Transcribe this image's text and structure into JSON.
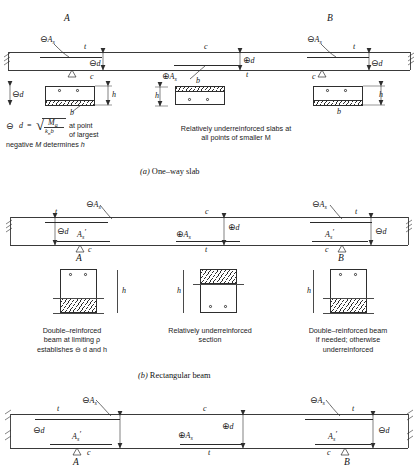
{
  "figure": {
    "title_note": "Reinforced concrete design — depth determination diagrams"
  },
  "symbols": {
    "neg": "⊖",
    "pos": "⊕",
    "neg_As": "⊖A",
    "pos_As": "⊕A",
    "neg_d": "⊖d",
    "pos_d": "⊕d",
    "sub_s": "s",
    "t": "t",
    "c": "c",
    "h": "h",
    "b": "b",
    "d": "d",
    "A": "A",
    "B": "B",
    "As_prime": "A",
    "prime_mark": "′"
  },
  "panel_a": {
    "id": "one-way-slab",
    "caption": "One–way slab",
    "caption_letter": "(a)",
    "point_left": "A",
    "point_right": "B",
    "labels": {
      "neg_As_left": "⊖A",
      "neg_As_right": "⊖A",
      "pos_As_mid": "⊕A",
      "t_left": "t",
      "t_mid": "t",
      "t_right": "t",
      "c_left": "c",
      "c_mid": "c",
      "c_right": "c",
      "neg_d_left": "⊖d",
      "pos_d_mid": "⊕d",
      "neg_d_right": "⊖d"
    },
    "sections": [
      {
        "name": "section-left",
        "h_label": "h",
        "d_label": "⊖d",
        "b_label": "b",
        "hatch_position": "bottom",
        "bars_position": "top",
        "bar_count": 2
      },
      {
        "name": "section-mid",
        "h_label": "h",
        "d_label": "",
        "b_label": "b",
        "hatch_position": "top",
        "bars_position": "bottom",
        "bar_count": 2
      },
      {
        "name": "section-right",
        "h_label": "h",
        "d_label": "",
        "b_label": "b",
        "hatch_position": "bottom",
        "bars_position": "top",
        "bar_count": 2
      }
    ],
    "formula": {
      "lead_symbol": "⊖",
      "lhs": "d",
      "equals": "=",
      "radical": "√",
      "numerator": "M",
      "numerator_sub": "a",
      "denominator": "k",
      "denominator_sub": "n",
      "denominator_tail": "b",
      "text_line1": "at point",
      "text_line2": "of largest",
      "text_line3": "negative M determines h"
    },
    "note_right": "Relatively underreinforced slabs at\nall points of smaller M"
  },
  "panel_b": {
    "id": "rectangular-beam",
    "caption": "Rectangular beam",
    "caption_letter": "(b)",
    "point_left": "A",
    "point_right": "B",
    "labels": {
      "neg_As_left": "⊖A",
      "neg_As_right": "⊖A",
      "pos_As_mid": "⊕A",
      "As_prime_left": "A",
      "As_prime_right": "A",
      "t_left": "t",
      "t_mid": "t",
      "t_right": "t",
      "c_left": "c",
      "c_mid": "c",
      "c_right": "c",
      "neg_d_left": "⊖d",
      "pos_d_mid": "⊕d",
      "neg_d_right": "⊖d"
    },
    "sections": [
      {
        "name": "section-left",
        "h_label": "h",
        "hatch_position": "bottom",
        "bars_position": "top",
        "bar_count": 2
      },
      {
        "name": "section-mid",
        "h_label": "h",
        "hatch_position": "top",
        "bars_position": "bottom",
        "bar_count": 2
      },
      {
        "name": "section-right",
        "h_label": "h",
        "hatch_position": "bottom",
        "bars_position": "top",
        "bar_count": 2
      }
    ],
    "notes": [
      "Double–reinforced\nbeam at limiting ρ\nestablishes ⊖ d and h",
      "Relatively underreinforced\nsection",
      "Double–reinforced beam\nif needed; otherwise\nunderreinforced"
    ]
  },
  "panel_c": {
    "id": "third-beam-elevation",
    "point_left": "A",
    "point_right": "B",
    "labels": {
      "neg_As_left": "⊖A",
      "neg_As_right": "⊖A",
      "pos_As_mid": "⊕A",
      "As_prime_left": "A",
      "As_prime_right": "A",
      "t_left": "t",
      "t_mid": "t",
      "t_right": "t",
      "c_left": "c",
      "c_mid": "c",
      "c_right": "c",
      "neg_d_left": "⊖d",
      "pos_d_mid": "⊕d",
      "neg_d_right": "⊖d"
    }
  }
}
